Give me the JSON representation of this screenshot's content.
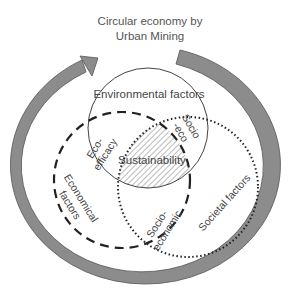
{
  "title": {
    "line1": "Circular economy by",
    "line2": "Urban Mining"
  },
  "circles": {
    "environmental": {
      "label": "Environmental factors",
      "style": "solid"
    },
    "economical": {
      "label_line1": "Economical",
      "label_line2": "factors",
      "style": "dashed"
    },
    "societal": {
      "label": "Societal factors",
      "style": "dotted"
    }
  },
  "overlaps": {
    "eco_efficacy": {
      "line1": "Eco-",
      "line2": "efficacy"
    },
    "socio_eco": {
      "line1": "Socio",
      "line2": "-eco"
    },
    "socio_economic": {
      "line1": "Socio-",
      "line2": "economic"
    },
    "center": "Sustainability"
  },
  "colors": {
    "ring": "#8c8c8c",
    "ring_edge": "#555555",
    "lines": "#222222",
    "text": "#444444"
  }
}
